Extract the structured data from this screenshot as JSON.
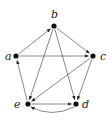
{
  "diagram": {
    "type": "directed-graph",
    "nodes": [
      {
        "id": "a",
        "label": "a",
        "x": 16,
        "y": 56,
        "lx": 5,
        "ly": 60
      },
      {
        "id": "b",
        "label": "b",
        "x": 54,
        "y": 26,
        "lx": 51,
        "ly": 18
      },
      {
        "id": "c",
        "label": "c",
        "x": 93,
        "y": 56,
        "lx": 100,
        "ly": 60
      },
      {
        "id": "d",
        "label": "d",
        "x": 76,
        "y": 104,
        "lx": 82,
        "ly": 108
      },
      {
        "id": "e",
        "label": "e",
        "x": 28,
        "y": 104,
        "lx": 14,
        "ly": 108
      }
    ],
    "edges": [
      {
        "from": "a",
        "to": "b"
      },
      {
        "from": "b",
        "to": "c"
      },
      {
        "from": "a",
        "to": "c"
      },
      {
        "from": "b",
        "to": "e"
      },
      {
        "from": "b",
        "to": "d"
      },
      {
        "from": "c",
        "to": "e"
      },
      {
        "from": "c",
        "to": "d"
      },
      {
        "from": "e",
        "to": "a"
      },
      {
        "from": "e",
        "to": "d"
      },
      {
        "from": "d",
        "to": "e",
        "curved": true
      }
    ]
  }
}
